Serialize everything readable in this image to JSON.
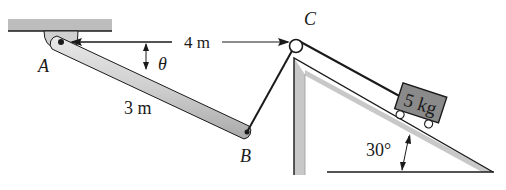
{
  "diagram": {
    "type": "mechanics-problem-figure",
    "points": {
      "A": {
        "label": "A"
      },
      "B": {
        "label": "B"
      },
      "C": {
        "label": "C"
      }
    },
    "dimensions": {
      "horizontal_AC": "4 m",
      "bar_AB_length": "3 m",
      "angle_theta": "θ",
      "incline_angle": "30°"
    },
    "block": {
      "mass_label": "5 kg"
    },
    "colors": {
      "ink": "#1a1a1a",
      "fill_gray": "#c8c8c8",
      "bar_gray": "#d4d4d4",
      "ceiling_gray": "#bdbdbd"
    }
  }
}
